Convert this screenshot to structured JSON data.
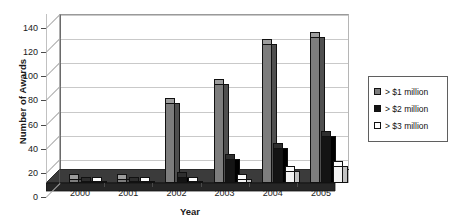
{
  "chart_data": {
    "type": "bar",
    "title": "",
    "subtitle": "",
    "xlabel": "Year",
    "ylabel": "Number of Awards",
    "categories": [
      "2000",
      "2001",
      "2002",
      "2003",
      "2004",
      "2005"
    ],
    "series": [
      {
        "name": "> $1 million",
        "color": "#7d7d7d",
        "values": [
          3,
          3,
          66,
          82,
          115,
          121
        ]
      },
      {
        "name": "> $2 million",
        "color": "#141414",
        "values": [
          1,
          1,
          5,
          20,
          29,
          39
        ]
      },
      {
        "name": "> $3 million",
        "color": "#ffffff",
        "values": [
          1,
          1,
          1,
          3,
          10,
          14
        ]
      }
    ],
    "ylim": [
      0,
      140
    ],
    "yticks": [
      0,
      20,
      40,
      60,
      80,
      100,
      120,
      140
    ],
    "ytick_labels": [
      "0",
      "20",
      "40",
      "60",
      "80",
      "100",
      "120",
      "140"
    ],
    "grid": true,
    "grid_axis": "y",
    "legend_position": "right",
    "style": "3d-column",
    "background": "#ffffff"
  },
  "legend": {
    "items": [
      {
        "label": "> $1 million",
        "swatch": "series-1-swatch"
      },
      {
        "label": "> $2 million",
        "swatch": "series-2-swatch"
      },
      {
        "label": "> $3 million",
        "swatch": "series-3-swatch"
      }
    ]
  }
}
